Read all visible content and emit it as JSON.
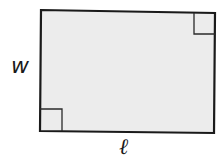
{
  "diagram": {
    "type": "rectangle with right-angle markers",
    "shape": "rectangle",
    "fill_color": "#ececec",
    "stroke_color": "#1a1a1a",
    "labels": {
      "width": "w",
      "length": "ℓ"
    },
    "right_angle_markers": [
      "top-right",
      "bottom-left"
    ]
  }
}
